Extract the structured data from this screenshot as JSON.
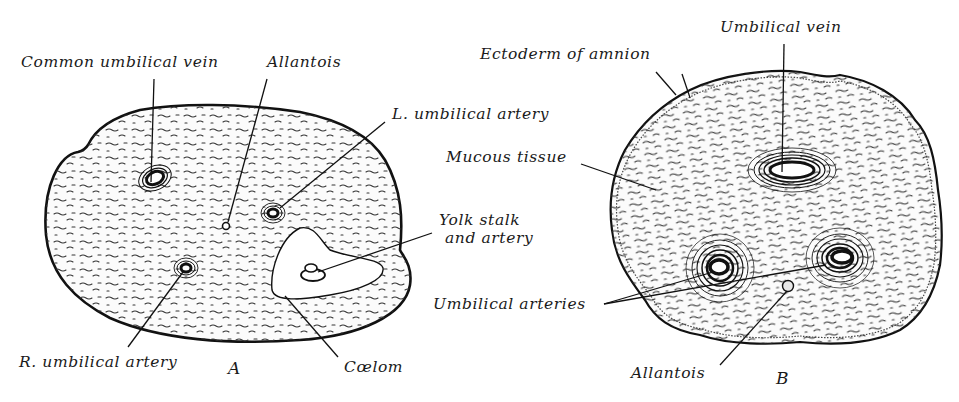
{
  "figure": {
    "panels": [
      {
        "id": "A",
        "letter": "A",
        "labels": {
          "common_umbilical_vein": "Common umbilical vein",
          "allantois": "Allantois",
          "l_umbilical_artery": "L. umbilical artery",
          "yolk_stalk_line1": "Yolk stalk",
          "yolk_stalk_line2": "and artery",
          "r_umbilical_artery": "R. umbilical artery",
          "coelom": "Cœlom"
        }
      },
      {
        "id": "B",
        "letter": "B",
        "labels": {
          "umbilical_vein": "Umbilical vein",
          "ectoderm_of_amnion": "Ectoderm of amnion",
          "mucous_tissue": "Mucous tissue",
          "umbilical_arteries": "Umbilical arteries",
          "allantois": "Allantois"
        }
      }
    ],
    "colors": {
      "ink": "#111111",
      "background": "#ffffff"
    }
  }
}
